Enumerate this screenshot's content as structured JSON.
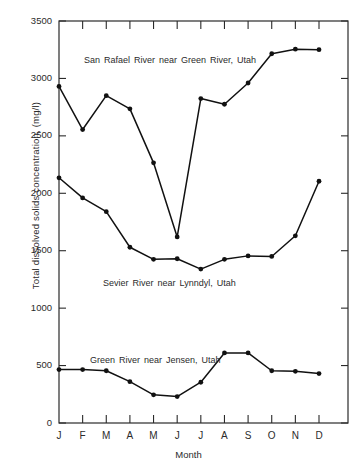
{
  "chart_data": {
    "type": "line",
    "title": "",
    "xlabel": "Month",
    "ylabel": "Total dissolved solids concentration, (mg/l)",
    "categories": [
      "J",
      "F",
      "M",
      "A",
      "M",
      "J",
      "J",
      "A",
      "S",
      "O",
      "N",
      "D"
    ],
    "xtick_labels": [
      "J",
      "F",
      "M",
      "A",
      "M",
      "J",
      "J",
      "A",
      "S",
      "O",
      "N",
      "D"
    ],
    "ytick_labels": [
      "0",
      "500",
      "1000",
      "1500",
      "2000",
      "2500",
      "3000",
      "3500"
    ],
    "yticks": [
      0,
      500,
      1000,
      1500,
      2000,
      2500,
      3000,
      3500
    ],
    "ylim": [
      0,
      3500
    ],
    "grid": false,
    "legend_position": "inline-annotations",
    "marker": "filled-circle",
    "line_color": "#111111",
    "series": [
      {
        "name": "San Rafael River near Green River, Utah",
        "values": [
          2930,
          2555,
          2850,
          2735,
          2265,
          1620,
          2825,
          2775,
          2960,
          3215,
          3255,
          3250
        ]
      },
      {
        "name": "Sevier River near Lynndyl, Utah",
        "values": [
          2135,
          1960,
          1840,
          1530,
          1425,
          1430,
          1340,
          1425,
          1455,
          1450,
          1630,
          2105
        ]
      },
      {
        "name": "Green River near Jensen, Utah",
        "values": [
          465,
          465,
          455,
          360,
          245,
          230,
          355,
          610,
          610,
          455,
          450,
          430
        ]
      }
    ],
    "annotations": [
      {
        "text": "San Rafael River near Green River, Utah",
        "x_px": 84,
        "y_px": 55
      },
      {
        "text": "Sevier River near Lynndyl, Utah",
        "x_px": 103,
        "y_px": 278
      },
      {
        "text": "Green River near Jensen, Utah",
        "x_px": 90,
        "y_px": 355
      }
    ]
  }
}
